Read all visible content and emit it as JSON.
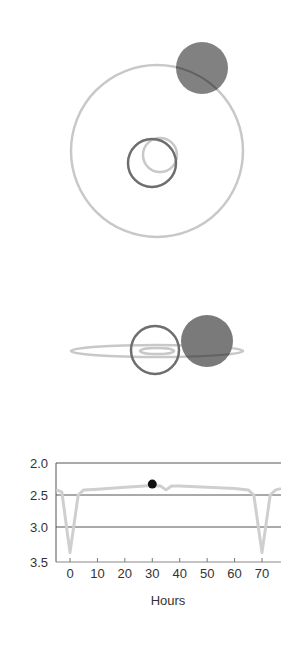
{
  "colors": {
    "orbit": "#c8c8c8",
    "star_outline": "#6e6e6e",
    "planet_fill": "#7a7a7a",
    "gridline": "#555555",
    "light_curve": "#cfcfcf",
    "marker": "#111111",
    "text": "#333333"
  },
  "top_view": {
    "big_orbit": {
      "cx": 157,
      "cy": 151,
      "r": 86
    },
    "star": {
      "cx": 152,
      "cy": 163,
      "r": 24
    },
    "small_orbit": {
      "cx": 160,
      "cy": 155,
      "r": 17
    },
    "planet": {
      "cx": 202,
      "cy": 68,
      "r": 26
    }
  },
  "side_view": {
    "outer_orbit": {
      "cx": 157,
      "cy": 351,
      "rx": 86,
      "ry": 6
    },
    "inner_orbit": {
      "cx": 157,
      "cy": 351,
      "rx": 17,
      "ry": 3
    },
    "star": {
      "cx": 155,
      "cy": 350,
      "r": 24
    },
    "planet": {
      "cx": 207,
      "cy": 341,
      "r": 26
    }
  },
  "chart_data": {
    "type": "line",
    "title": "",
    "xlabel": "Hours",
    "ylabel": "",
    "xlim": [
      -5,
      77
    ],
    "ylim": [
      3.5,
      2.0
    ],
    "y_inverted": true,
    "grid": "horizontal",
    "x_ticks": [
      0,
      10,
      20,
      30,
      40,
      50,
      60,
      70
    ],
    "x_tick_labels": [
      "0",
      "10",
      "20",
      "30",
      "40",
      "50",
      "60",
      "70"
    ],
    "y_ticks": [
      2.0,
      2.5,
      3.0,
      3.5
    ],
    "y_tick_labels": [
      "2.0",
      "2.5",
      "3.0",
      "3.5"
    ],
    "series": [
      {
        "name": "light curve",
        "x": [
          -5,
          -3,
          0,
          3,
          5,
          10,
          20,
          30,
          33,
          35,
          37,
          40,
          50,
          60,
          65,
          67,
          70,
          73,
          75,
          77
        ],
        "y": [
          2.42,
          2.45,
          3.4,
          2.5,
          2.42,
          2.41,
          2.38,
          2.35,
          2.36,
          2.42,
          2.36,
          2.36,
          2.38,
          2.4,
          2.42,
          2.5,
          3.4,
          2.5,
          2.42,
          2.4
        ]
      }
    ],
    "marker": {
      "x": 30,
      "y": 2.33,
      "label": "current position"
    },
    "legend": []
  }
}
